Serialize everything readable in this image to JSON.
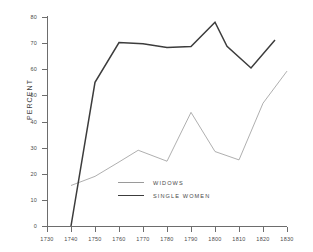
{
  "chart_data": {
    "type": "line",
    "title": "",
    "xlabel": "",
    "ylabel": "PERCENT",
    "xlim": [
      1730,
      1830
    ],
    "ylim": [
      0,
      80
    ],
    "grid": false,
    "legend_position": "inside-bottom-center",
    "x_ticks": [
      1730,
      1740,
      1750,
      1760,
      1770,
      1780,
      1790,
      1800,
      1810,
      1820,
      1830
    ],
    "y_ticks": [
      0,
      10,
      20,
      30,
      40,
      50,
      60,
      70,
      80
    ],
    "series": [
      {
        "name": "WIDOWS",
        "color": "#9a9a9a",
        "line_width": "thin",
        "points": [
          {
            "x": 1740,
            "y": 15.5
          },
          {
            "x": 1750,
            "y": 19.0
          },
          {
            "x": 1760,
            "y": 24.5
          },
          {
            "x": 1768,
            "y": 29.0
          },
          {
            "x": 1780,
            "y": 24.8
          },
          {
            "x": 1790,
            "y": 43.5
          },
          {
            "x": 1800,
            "y": 28.5
          },
          {
            "x": 1810,
            "y": 25.3
          },
          {
            "x": 1820,
            "y": 47.0
          },
          {
            "x": 1830,
            "y": 59.3
          }
        ]
      },
      {
        "name": "SINGLE WOMEN",
        "color": "#3c3c3c",
        "line_width": "thick",
        "points": [
          {
            "x": 1740,
            "y": 0.0
          },
          {
            "x": 1750,
            "y": 55.0
          },
          {
            "x": 1760,
            "y": 70.2
          },
          {
            "x": 1770,
            "y": 69.8
          },
          {
            "x": 1780,
            "y": 68.3
          },
          {
            "x": 1790,
            "y": 68.7
          },
          {
            "x": 1800,
            "y": 78.0
          },
          {
            "x": 1805,
            "y": 68.8
          },
          {
            "x": 1815,
            "y": 60.5
          },
          {
            "x": 1825,
            "y": 71.2
          }
        ]
      }
    ]
  },
  "axis": {
    "y_tick_labels": [
      "80",
      "70",
      "60",
      "50",
      "40",
      "30",
      "20",
      "10",
      "0"
    ],
    "x_tick_labels": [
      "1730",
      "1740",
      "1750",
      "1760",
      "1770",
      "1780",
      "1790",
      "1800",
      "1810",
      "1820",
      "1830"
    ],
    "y_axis_title": "PERCENT"
  },
  "legend": {
    "items": [
      {
        "label": "WIDOWS"
      },
      {
        "label": "SINGLE WOMEN"
      }
    ]
  }
}
